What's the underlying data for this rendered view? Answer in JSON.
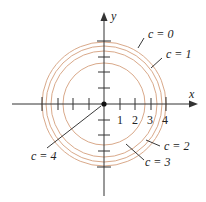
{
  "diagram": {
    "type": "level-curves",
    "axes": {
      "x_label": "x",
      "y_label": "y",
      "x_ticks": [
        "1",
        "2",
        "3",
        "4"
      ],
      "tick_range": [
        -4,
        4
      ]
    },
    "origin_point": "origin",
    "curves": [
      {
        "label": "c = 0",
        "radius": 4
      },
      {
        "label": "c = 1",
        "radius": 3.873
      },
      {
        "label": "c = 2",
        "radius": 3.464
      },
      {
        "label": "c = 3",
        "radius": 2.646
      },
      {
        "label": "c = 4",
        "radius": 0
      }
    ],
    "colors": {
      "axis": "#333333",
      "curve": "#d9a98a",
      "point": "#111111"
    }
  }
}
